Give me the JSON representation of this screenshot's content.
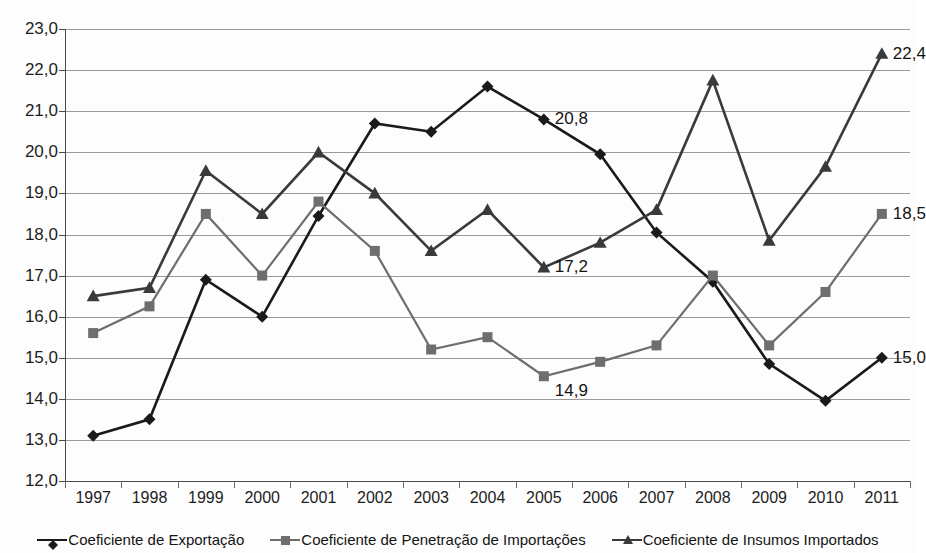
{
  "chart_data": {
    "type": "line",
    "title": "",
    "subtitle": "",
    "xlabel": "",
    "ylabel": "",
    "categories": [
      "1997",
      "1998",
      "1999",
      "2000",
      "2001",
      "2002",
      "2003",
      "2004",
      "2005",
      "2006",
      "2007",
      "2008",
      "2009",
      "2010",
      "2011"
    ],
    "ylim": [
      12.0,
      23.0
    ],
    "ytick_labels": [
      "12,0",
      "13,0",
      "14,0",
      "15,0",
      "16,0",
      "17,0",
      "18,0",
      "19,0",
      "20,0",
      "21,0",
      "22,0",
      "23,0"
    ],
    "ytick_values": [
      12.0,
      13.0,
      14.0,
      15.0,
      16.0,
      17.0,
      18.0,
      19.0,
      20.0,
      21.0,
      22.0,
      23.0
    ],
    "grid": true,
    "grid_axis": "y",
    "legend_position": "bottom",
    "decimal_separator": ",",
    "series": [
      {
        "name": "Coeficiente de Exportação",
        "marker": "diamond",
        "color": "#1a1a1a",
        "values": [
          13.1,
          13.5,
          16.9,
          16.0,
          18.45,
          20.7,
          20.5,
          21.6,
          20.8,
          19.95,
          18.05,
          16.85,
          14.85,
          13.95,
          15.0
        ]
      },
      {
        "name": "Coeficiente de Penetração de Importações",
        "marker": "square",
        "color": "#6e6e6e",
        "values": [
          15.6,
          16.25,
          18.5,
          17.0,
          18.8,
          17.6,
          15.2,
          15.5,
          14.55,
          14.9,
          15.3,
          17.0,
          15.3,
          16.6,
          18.5
        ]
      },
      {
        "name": "Coeficiente de Insumos Importados",
        "marker": "triangle",
        "color": "#3a3a3a",
        "values": [
          16.5,
          16.7,
          19.55,
          18.5,
          20.0,
          19.0,
          17.6,
          18.6,
          17.2,
          17.8,
          18.6,
          21.75,
          17.85,
          19.65,
          22.4
        ]
      }
    ],
    "data_labels": [
      {
        "series": "Coeficiente de Exportação",
        "category": "2005",
        "text": "20,8",
        "anchor": "right"
      },
      {
        "series": "Coeficiente de Insumos Importados",
        "category": "2005",
        "text": "17,2",
        "anchor": "right"
      },
      {
        "series": "Coeficiente de Penetração de Importações",
        "category": "2005",
        "text": "14,9",
        "anchor": "right-below"
      },
      {
        "series": "Coeficiente de Insumos Importados",
        "category": "2011",
        "text": "22,4",
        "anchor": "right"
      },
      {
        "series": "Coeficiente de Penetração de Importações",
        "category": "2011",
        "text": "18,5",
        "anchor": "right"
      },
      {
        "series": "Coeficiente de Exportação",
        "category": "2011",
        "text": "15,0",
        "anchor": "right"
      }
    ]
  },
  "legend": {
    "items": [
      {
        "label": "Coeficiente de Exportação",
        "marker": "diamond-marker-icon",
        "color": "#1a1a1a"
      },
      {
        "label": "Coeficiente de Penetração de Importações",
        "marker": "square-marker-icon",
        "color": "#6e6e6e"
      },
      {
        "label": "Coeficiente de Insumos Importados",
        "marker": "triangle-marker-icon",
        "color": "#3a3a3a"
      }
    ]
  }
}
